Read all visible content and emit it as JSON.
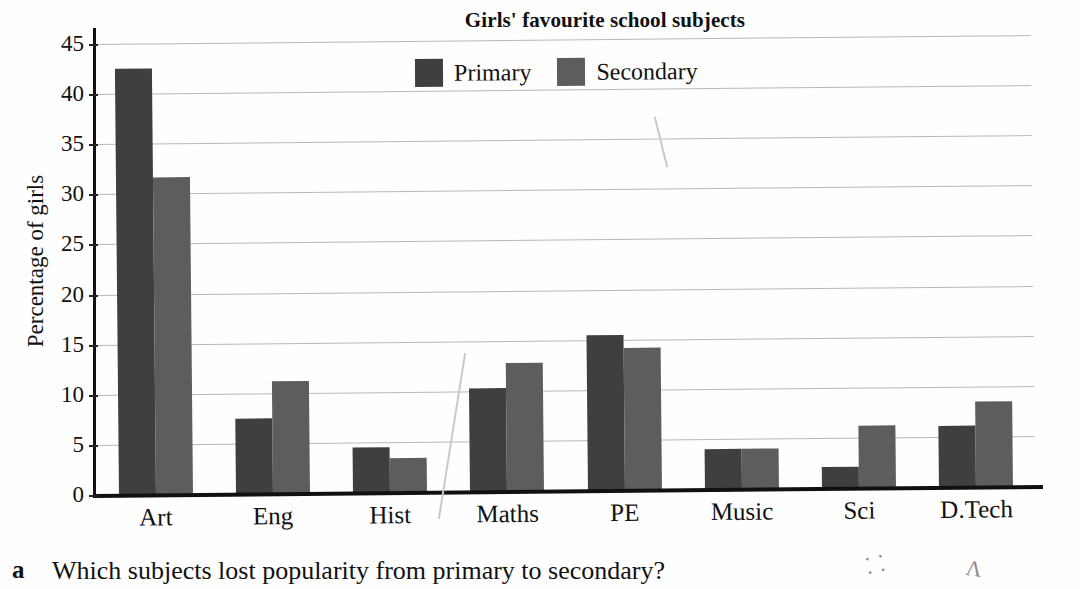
{
  "chart_data": {
    "type": "bar",
    "title": "Girls' favourite school subjects",
    "xlabel": "",
    "ylabel": "Percentage of girls",
    "ylim": [
      0,
      45
    ],
    "ytick_step": 5,
    "grid": true,
    "legend_position": "top-center",
    "categories": [
      "Art",
      "Eng",
      "Hist",
      "Maths",
      "PE",
      "Music",
      "Sci",
      "D.Tech"
    ],
    "series": [
      {
        "name": "Primary",
        "color": "#3f3f3f",
        "values": [
          42.5,
          7.5,
          4.5,
          10.3,
          15.5,
          4.0,
          2.1,
          6.1
        ]
      },
      {
        "name": "Secondary",
        "color": "#5d5d5d",
        "values": [
          31.6,
          11.2,
          3.4,
          12.8,
          14.2,
          4.0,
          6.2,
          8.5
        ]
      }
    ],
    "ytick_labels": [
      "0",
      "5",
      "10",
      "15",
      "20",
      "25",
      "30",
      "35",
      "40",
      "45"
    ]
  },
  "question": {
    "marker": "a",
    "text": "Which subjects lost popularity from primary to secondary?"
  }
}
